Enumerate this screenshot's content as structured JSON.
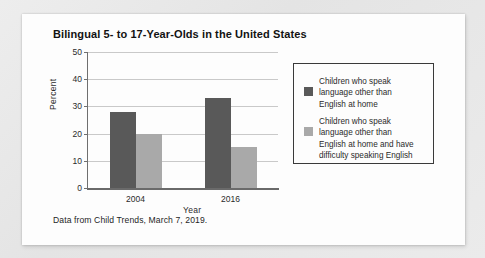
{
  "chart_data": {
    "type": "bar",
    "title": "Bilingual 5- to 17-Year-Olds in the United States",
    "xlabel": "Year",
    "ylabel": "Percent",
    "categories": [
      "2004",
      "2016"
    ],
    "yticks": [
      "0",
      "10",
      "20",
      "30",
      "40",
      "50"
    ],
    "ylim": [
      0,
      50
    ],
    "grid": true,
    "legend_position": "right",
    "series": [
      {
        "name": "Children who speak language other than English at home",
        "name_lines": [
          "Children who speak",
          "language other than",
          "English at home"
        ],
        "color": "#595959",
        "values": [
          28,
          33
        ]
      },
      {
        "name": "Children who speak language other than English at home and have difficulty speaking English",
        "name_lines": [
          "Children who speak",
          "language other than",
          "English at home and have",
          "difficulty speaking English"
        ],
        "color": "#a9a9a9",
        "values": [
          20,
          15
        ]
      }
    ],
    "source_note": "Data from Child Trends, March 7, 2019."
  }
}
